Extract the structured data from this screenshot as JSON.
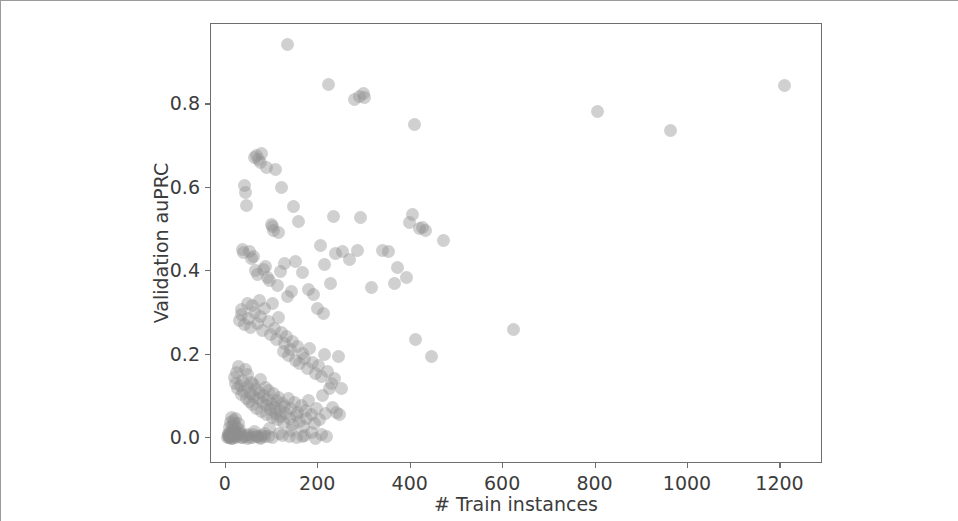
{
  "chart_data": {
    "type": "scatter",
    "title": "",
    "xlabel": "# Train instances",
    "ylabel": "Validation auPRC",
    "xlim": [
      -32,
      1292
    ],
    "ylim": [
      -0.062,
      0.993
    ],
    "xticks": [
      0,
      200,
      400,
      600,
      800,
      1000,
      1200
    ],
    "xticklabels": [
      "0",
      "200",
      "400",
      "600",
      "800",
      "1000",
      "1200"
    ],
    "yticks": [
      0.0,
      0.2,
      0.4,
      0.6,
      0.8
    ],
    "yticklabels": [
      "0.0",
      "0.2",
      "0.4",
      "0.6",
      "0.8"
    ],
    "grid": false,
    "legend": null,
    "marker_color": "#8f8f8f",
    "marker_opacity": 0.42,
    "marker_size_px": 13,
    "series": [
      {
        "name": "models",
        "x": [
          133,
          222,
          278,
          289,
          297,
          300,
          408,
          805,
          962,
          1208,
          62,
          66,
          71,
          74,
          78,
          88,
          40,
          43,
          45,
          108,
          232,
          121,
          147,
          98,
          100,
          104,
          113,
          158,
          291,
          340,
          366,
          398,
          404,
          420,
          426,
          432,
          470,
          205,
          214,
          226,
          36,
          38,
          52,
          56,
          60,
          64,
          69,
          81,
          86,
          90,
          95,
          112,
          118,
          126,
          134,
          142,
          151,
          166,
          178,
          190,
          199,
          212,
          238,
          252,
          268,
          286,
          316,
          352,
          372,
          390,
          410,
          446,
          623,
          30,
          33,
          35,
          41,
          47,
          50,
          54,
          58,
          63,
          68,
          72,
          76,
          80,
          84,
          92,
          96,
          102,
          106,
          110,
          115,
          120,
          124,
          128,
          132,
          136,
          140,
          145,
          150,
          155,
          160,
          165,
          170,
          176,
          182,
          188,
          194,
          200,
          206,
          213,
          220,
          228,
          235,
          243,
          250,
          18,
          21,
          24,
          26,
          28,
          31,
          34,
          37,
          39,
          42,
          44,
          46,
          48,
          51,
          53,
          55,
          57,
          59,
          61,
          65,
          67,
          70,
          73,
          75,
          77,
          79,
          82,
          85,
          87,
          89,
          91,
          93,
          97,
          99,
          101,
          103,
          105,
          107,
          109,
          111,
          114,
          116,
          119,
          122,
          125,
          127,
          130,
          135,
          138,
          141,
          144,
          148,
          152,
          156,
          159,
          163,
          168,
          172,
          175,
          180,
          185,
          192,
          197,
          203,
          209,
          216,
          224,
          231,
          240,
          246,
          8,
          10,
          12,
          14,
          15,
          16,
          17,
          19,
          20,
          22,
          23,
          25,
          27,
          29,
          32,
          49,
          62,
          78,
          94,
          117,
          143,
          167,
          186,
          208,
          5,
          6,
          7,
          9,
          11,
          13,
          18,
          24,
          30,
          36,
          44,
          52,
          60,
          68,
          76,
          84,
          92,
          100,
          123,
          137,
          154,
          171,
          195,
          218,
          4,
          6,
          8,
          11,
          14,
          17,
          21,
          26,
          33,
          40,
          48,
          57,
          66,
          74,
          83
        ],
        "y": [
          0.945,
          0.848,
          0.812,
          0.818,
          0.826,
          0.817,
          0.752,
          0.783,
          0.737,
          0.846,
          0.672,
          0.678,
          0.668,
          0.661,
          0.682,
          0.65,
          0.605,
          0.588,
          0.558,
          0.645,
          0.532,
          0.6,
          0.556,
          0.512,
          0.508,
          0.498,
          0.494,
          0.52,
          0.529,
          0.45,
          0.372,
          0.518,
          0.536,
          0.502,
          0.505,
          0.498,
          0.474,
          0.462,
          0.416,
          0.37,
          0.452,
          0.444,
          0.448,
          0.43,
          0.436,
          0.402,
          0.392,
          0.404,
          0.412,
          0.386,
          0.378,
          0.366,
          0.4,
          0.418,
          0.34,
          0.352,
          0.424,
          0.398,
          0.356,
          0.344,
          0.31,
          0.3,
          0.442,
          0.448,
          0.428,
          0.45,
          0.362,
          0.448,
          0.41,
          0.384,
          0.236,
          0.196,
          0.26,
          0.282,
          0.296,
          0.308,
          0.272,
          0.324,
          0.288,
          0.266,
          0.318,
          0.302,
          0.276,
          0.33,
          0.292,
          0.258,
          0.312,
          0.28,
          0.248,
          0.322,
          0.264,
          0.236,
          0.29,
          0.254,
          0.208,
          0.226,
          0.244,
          0.198,
          0.212,
          0.232,
          0.186,
          0.22,
          0.178,
          0.204,
          0.192,
          0.168,
          0.216,
          0.182,
          0.156,
          0.174,
          0.148,
          0.2,
          0.16,
          0.13,
          0.142,
          0.196,
          0.118,
          0.146,
          0.132,
          0.158,
          0.118,
          0.172,
          0.126,
          0.104,
          0.138,
          0.112,
          0.164,
          0.096,
          0.124,
          0.152,
          0.088,
          0.108,
          0.134,
          0.08,
          0.1,
          0.128,
          0.116,
          0.072,
          0.094,
          0.11,
          0.14,
          0.064,
          0.086,
          0.102,
          0.122,
          0.056,
          0.078,
          0.092,
          0.114,
          0.068,
          0.084,
          0.05,
          0.106,
          0.074,
          0.06,
          0.09,
          0.044,
          0.098,
          0.066,
          0.052,
          0.082,
          0.038,
          0.076,
          0.058,
          0.094,
          0.046,
          0.07,
          0.032,
          0.086,
          0.054,
          0.062,
          0.04,
          0.078,
          0.028,
          0.066,
          0.048,
          0.09,
          0.056,
          0.034,
          0.072,
          0.044,
          0.102,
          0.06,
          0.118,
          0.074,
          0.062,
          0.056,
          0.026,
          0.038,
          0.05,
          0.018,
          0.03,
          0.042,
          0.022,
          0.034,
          0.014,
          0.046,
          0.026,
          0.01,
          0.036,
          0.02,
          0.012,
          0.008,
          0.016,
          0.006,
          0.024,
          0.01,
          0.018,
          0.004,
          0.014,
          0.008,
          0.004,
          0.01,
          0.002,
          0.006,
          0.012,
          0.0,
          0.008,
          0.003,
          0.014,
          0.001,
          0.006,
          0.002,
          0.009,
          0.004,
          0.0,
          0.011,
          0.005,
          0.002,
          0.007,
          0.003,
          0.001,
          0.006,
          0.0,
          0.004,
          0.002,
          0.008,
          0.001,
          0.005,
          0.0,
          0.003,
          0.002,
          0.006,
          0.001,
          0.004,
          0.0,
          0.002,
          0.005,
          0.001,
          0.003
        ]
      }
    ]
  }
}
